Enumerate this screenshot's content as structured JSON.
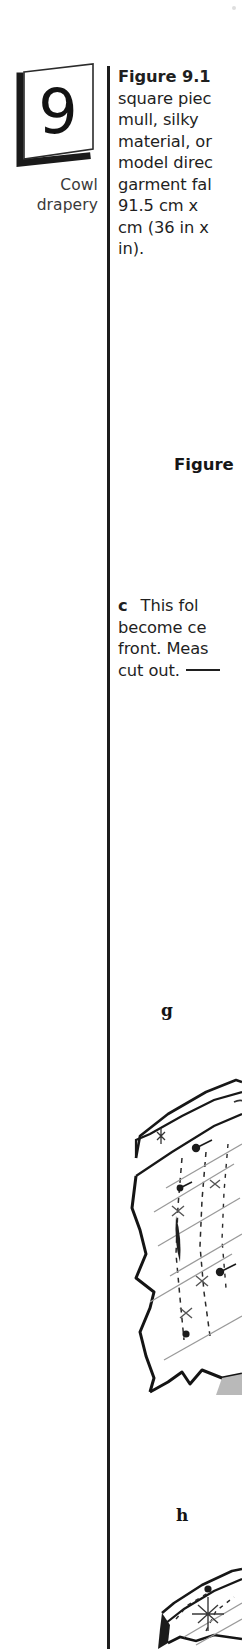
{
  "chapter": {
    "number": "9",
    "label_line1": "Cowl",
    "label_line2": "drapery"
  },
  "figure_intro": {
    "lines": [
      "Figure 9.1",
      "square piec",
      "mull, silky",
      "material, or",
      "model direc",
      "garment fal",
      "91.5 cm x",
      "cm (36 in x",
      "in)."
    ]
  },
  "figure_caption": "Figure",
  "step_c": {
    "marker": "c",
    "lines": [
      "This fol",
      "become ce",
      "front. Meas",
      "cut out."
    ]
  },
  "step_letters": {
    "g": "g",
    "h": "h"
  },
  "illustrations": {
    "g_name": "draped-bodice-illustration",
    "h_name": "draped-bodice-detail-illustration"
  },
  "colors": {
    "ink": "#1f1f1f",
    "rule": "#1d1d1d",
    "side_label": "#3a3a3a",
    "shading": "#b9b9b9",
    "guide": "#9a9a9a"
  }
}
